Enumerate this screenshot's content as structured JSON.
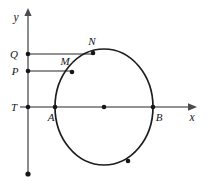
{
  "figure": {
    "kind": "geometry-diagram",
    "background_color": "#ffffff",
    "axis_color": "#6e6e72",
    "curve_color": "#1d1d20",
    "marker_color": "#15151a"
  },
  "axes": {
    "x_axis": {
      "label": "x",
      "label_x": 192,
      "label_y": 120,
      "y": 107,
      "x_start": 20,
      "x_end": 196,
      "arrow": "right"
    },
    "y_axis": {
      "label": "y",
      "label_x": 18,
      "label_y": 20,
      "x": 28,
      "y_start": 12,
      "y_end": 174,
      "arrow": "up"
    }
  },
  "shape": {
    "type": "ellipse",
    "center_x": 104,
    "center_y": 107,
    "radius_x": 49,
    "radius_y": 58
  },
  "guides": [
    {
      "name": "guide-Q-N",
      "x1": 28,
      "y1": 54,
      "x2": 95,
      "y2": 54
    },
    {
      "name": "guide-P-M",
      "x1": 28,
      "y1": 71,
      "x2": 73,
      "y2": 71
    }
  ],
  "points": [
    {
      "id": "Q",
      "label": "Q",
      "x": 28,
      "y": 54,
      "label_x": 14,
      "label_y": 58,
      "dot": true
    },
    {
      "id": "P",
      "label": "P",
      "x": 28,
      "y": 71,
      "label_x": 15,
      "label_y": 75,
      "dot": true
    },
    {
      "id": "T",
      "label": "T",
      "x": 28,
      "y": 107,
      "label_x": 14,
      "label_y": 111,
      "dot": true
    },
    {
      "id": "N",
      "label": "N",
      "x": 93,
      "y": 53,
      "label_x": 90,
      "label_y": 45,
      "dot": true
    },
    {
      "id": "M",
      "label": "M",
      "x": 72,
      "y": 72,
      "label_x": 64,
      "label_y": 65,
      "dot": true
    },
    {
      "id": "A",
      "label": "A",
      "x": 55,
      "y": 107,
      "label_x": 50,
      "label_y": 120,
      "dot": true
    },
    {
      "id": "B",
      "label": "B",
      "x": 153,
      "y": 107,
      "label_x": 157,
      "label_y": 121,
      "dot": true
    },
    {
      "id": "O",
      "label": "",
      "x": 104,
      "y": 107,
      "label_x": 0,
      "label_y": 0,
      "dot": true
    },
    {
      "id": "S",
      "label": "",
      "x": 128,
      "y": 161,
      "label_x": 0,
      "label_y": 0,
      "dot": true
    },
    {
      "id": "E",
      "label": "",
      "x": 28,
      "y": 174,
      "label_x": 0,
      "label_y": 0,
      "dot": true
    }
  ]
}
